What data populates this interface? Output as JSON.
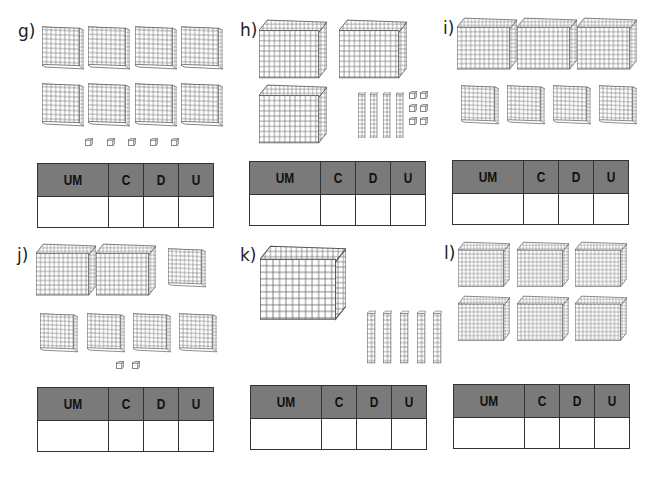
{
  "colors": {
    "header_fill": "#7a7a7a",
    "border": "#333333",
    "block_stroke": "#555555"
  },
  "table_headers": [
    "UM",
    "C",
    "D",
    "U"
  ],
  "exercises": [
    {
      "label": "g)",
      "blocks": {
        "cubes": 0,
        "flats": 8,
        "rods": 0,
        "units": 5
      }
    },
    {
      "label": "h)",
      "blocks": {
        "cubes": 3,
        "flats": 0,
        "rods": 4,
        "units": 6
      }
    },
    {
      "label": "i)",
      "blocks": {
        "cubes": 3,
        "flats": 4,
        "rods": 0,
        "units": 0
      }
    },
    {
      "label": "j)",
      "blocks": {
        "cubes": 2,
        "flats": 5,
        "rods": 0,
        "units": 2
      }
    },
    {
      "label": "k)",
      "blocks": {
        "cubes": 1,
        "flats": 0,
        "rods": 6,
        "units": 0
      }
    },
    {
      "label": "l)",
      "blocks": {
        "cubes": 6,
        "flats": 0,
        "rods": 0,
        "units": 0
      }
    }
  ]
}
